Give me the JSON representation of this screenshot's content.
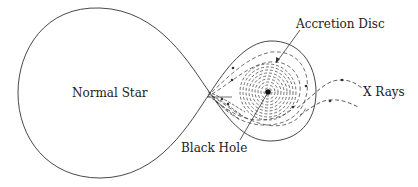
{
  "diagram": {
    "labels": {
      "normal_star": "Normal Star",
      "accretion_disc": "Accretion Disc",
      "black_hole": "Black Hole",
      "x_rays": "X Rays"
    },
    "colors": {
      "line": "#333333",
      "background": "#ffffff",
      "text": "#222222"
    },
    "nodes": [
      {
        "id": "normal-star",
        "label": "Normal Star",
        "shape": "roche-lobe-large"
      },
      {
        "id": "accretion-disc",
        "label": "Accretion Disc",
        "shape": "concentric-dashed-circles"
      },
      {
        "id": "black-hole",
        "label": "Black Hole",
        "shape": "dot"
      },
      {
        "id": "x-rays",
        "label": "X Rays",
        "shape": "dashed-arrows"
      }
    ],
    "edges": [
      {
        "from": "normal-star",
        "to": "accretion-disc",
        "type": "mass-transfer-stream"
      },
      {
        "from": "accretion-disc",
        "to": "x-rays",
        "type": "emission"
      }
    ]
  }
}
